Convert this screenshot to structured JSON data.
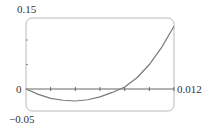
{
  "chart_data": {
    "type": "line",
    "title": "",
    "xlabel": "",
    "ylabel": "",
    "xlim": [
      0,
      0.012
    ],
    "ylim": [
      -0.05,
      0.15
    ],
    "grid": false,
    "legend": null,
    "x_tick_labels": [
      "0.012"
    ],
    "y_tick_labels": [
      "0.15",
      "0",
      "-0.05"
    ],
    "x_ticks": [
      0,
      0.002,
      0.004,
      0.006,
      0.008,
      0.01,
      0.012
    ],
    "y_ticks": [
      -0.05,
      0,
      0.05,
      0.1,
      0.15
    ],
    "series": [
      {
        "name": "f(x)",
        "x": [
          0,
          0.001,
          0.002,
          0.003,
          0.004,
          0.005,
          0.006,
          0.007,
          0.008,
          0.009,
          0.01,
          0.011,
          0.012
        ],
        "y": [
          0,
          -0.011,
          -0.019,
          -0.023,
          -0.0245,
          -0.022,
          -0.016,
          -0.007,
          0.004,
          0.023,
          0.05,
          0.085,
          0.128
        ]
      }
    ]
  },
  "labels": {
    "y_top": "0.15",
    "y_zero": "0",
    "y_bottom": "−0.05",
    "x_right": "0.012"
  },
  "colors": {
    "frame": "#b5b5b5",
    "axis": "#666666",
    "curve": "#7a7a7a",
    "text": "#333333"
  }
}
